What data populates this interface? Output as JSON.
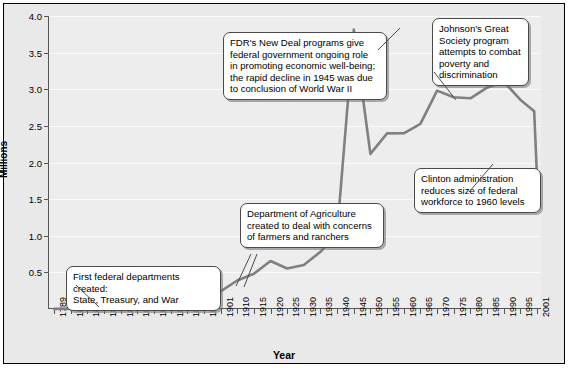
{
  "chart_data": {
    "type": "line",
    "title": "",
    "xlabel": "Year",
    "ylabel": "Millions",
    "ylim": [
      0,
      4.0
    ],
    "yticks": [
      "0.5",
      "1.0",
      "1.5",
      "2.0",
      "2.5",
      "3.0",
      "3.5",
      "4.0"
    ],
    "ytick_values": [
      0.5,
      1.0,
      1.5,
      2.0,
      2.5,
      3.0,
      3.5,
      4.0
    ],
    "grid": true,
    "legend": "none",
    "xtick_labels": [
      "1789",
      "1816",
      "1821",
      "1831",
      "1841",
      "1851",
      "1861",
      "1871",
      "1881",
      "1891",
      "1901",
      "1910",
      "1915",
      "1920",
      "1925",
      "1930",
      "1935",
      "1940",
      "1945",
      "1950",
      "1955",
      "1960",
      "1965",
      "1970",
      "1975",
      "1980",
      "1985",
      "1990",
      "1995",
      "2001"
    ],
    "series": [
      {
        "name": "Federal civilian employment",
        "x": [
          1789,
          1816,
          1821,
          1831,
          1841,
          1851,
          1861,
          1871,
          1881,
          1891,
          1901,
          1910,
          1915,
          1920,
          1925,
          1930,
          1935,
          1940,
          1945,
          1950,
          1955,
          1960,
          1965,
          1970,
          1975,
          1980,
          1985,
          1990,
          1995,
          2000,
          2001
        ],
        "values": [
          0.001,
          0.005,
          0.007,
          0.012,
          0.019,
          0.027,
          0.037,
          0.053,
          0.101,
          0.158,
          0.24,
          0.389,
          0.48,
          0.655,
          0.553,
          0.601,
          0.781,
          1.043,
          3.816,
          2.117,
          2.397,
          2.399,
          2.528,
          2.982,
          2.89,
          2.876,
          3.021,
          3.105,
          2.858,
          2.7,
          1.8
        ]
      }
    ],
    "annotations": [
      {
        "id": "first-departments",
        "text": "First federal departments created: State, Treasury, and War",
        "lines": [
          "First federal departments created:",
          "State, Treasury, and War"
        ]
      },
      {
        "id": "agriculture",
        "text": "Department of Agriculture created to deal with concerns of farmers and ranchers",
        "lines": [
          "Department of Agriculture",
          "created to deal with concerns",
          "of farmers and ranchers"
        ]
      },
      {
        "id": "new-deal",
        "text": "FDR's New Deal programs give federal government ongoing role in promoting economic well-being; the rapid decline in 1945 was due to conclusion of World War II",
        "lines": [
          "FDR's New Deal programs give",
          "federal government ongoing role",
          "in promoting economic well-being;",
          "the rapid decline in 1945 was due",
          "to conclusion of World War II"
        ]
      },
      {
        "id": "great-society",
        "text": "Johnson's Great Society program attempts to combat poverty and discrimination",
        "lines": [
          "Johnson's Great",
          "Society program",
          "attempts to combat",
          "poverty and",
          "discrimination"
        ]
      },
      {
        "id": "clinton",
        "text": "Clinton administration reduces size of federal workforce to 1960 levels",
        "lines": [
          "Clinton administration",
          "reduces size of federal",
          "workforce to 1960 levels"
        ]
      }
    ],
    "colors": {
      "line": "#808080",
      "plot_background": "#ededed",
      "figure_background": "#e9e9e9",
      "gridline": "#fbfbfb",
      "axis": "#555555",
      "callout_border": "#4a4a4a",
      "callout_background": "#ffffff",
      "text": "#000000"
    }
  },
  "axes": {
    "ylabel": "Millions",
    "xlabel": "Year"
  },
  "callouts": {
    "first_departments": {
      "line1": "First federal departments created:",
      "line2": "State, Treasury, and War"
    },
    "agriculture": {
      "line1": "Department of Agriculture",
      "line2": "created to deal with concerns",
      "line3": "of farmers and ranchers"
    },
    "new_deal": {
      "line1": "FDR's New Deal programs give",
      "line2": "federal government ongoing role",
      "line3": "in promoting economic well-being;",
      "line4": "the rapid decline in 1945 was due",
      "line5": "to conclusion of World War II"
    },
    "great_society": {
      "line1": "Johnson's Great",
      "line2": "Society program",
      "line3": "attempts to combat",
      "line4": "poverty and",
      "line5": "discrimination"
    },
    "clinton": {
      "line1": "Clinton administration",
      "line2": "reduces size of federal",
      "line3": "workforce to 1960 levels"
    }
  }
}
